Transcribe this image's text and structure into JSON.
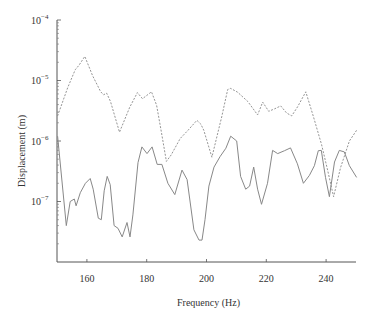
{
  "chart_data": {
    "type": "line",
    "title": "",
    "xlabel": "Frequency (Hz)",
    "ylabel": "Displacement (m)",
    "xlim": [
      150,
      250
    ],
    "ylim": [
      1e-08,
      0.0001
    ],
    "yscale": "log",
    "xticks": [
      160,
      180,
      200,
      220,
      240
    ],
    "xtick_labels": [
      "160",
      "180",
      "200",
      "220",
      "240"
    ],
    "yticks": [
      1e-07,
      1e-06,
      1e-05,
      0.0001
    ],
    "ytick_labels": [
      {
        "base": "10",
        "exp": "−7"
      },
      {
        "base": "10",
        "exp": "−6"
      },
      {
        "base": "10",
        "exp": "−5"
      },
      {
        "base": "10",
        "exp": "−4"
      }
    ],
    "grid": false,
    "legend": null,
    "series": [
      {
        "name": "dashed",
        "style": "dashed",
        "color": "#888888",
        "x": [
          150.2,
          153.6,
          156.1,
          157.4,
          159.3,
          161.9,
          164.6,
          165.6,
          166.6,
          167.9,
          170.9,
          174.3,
          176.9,
          178.6,
          181.6,
          183.3,
          184.9,
          186.6,
          188.2,
          191.2,
          193.8,
          196.8,
          198.1,
          199.1,
          201.8,
          205.1,
          207.1,
          208.1,
          210.4,
          213.8,
          217.1,
          218.8,
          220.8,
          222.8,
          224.8,
          226.8,
          228.5,
          230.5,
          233.2,
          235.8,
          238.5,
          240.5,
          242.5,
          244.8,
          247.8,
          250.2
        ],
        "y": [
          2.6e-06,
          7.7e-06,
          1.5e-05,
          1.8e-05,
          2.5e-05,
          1.2e-05,
          6.5e-06,
          5.8e-06,
          6.2e-06,
          4.5e-06,
          1.4e-06,
          3.6e-06,
          6.3e-06,
          5e-06,
          6.5e-06,
          3.9e-06,
          1.4e-06,
          4.6e-07,
          5.9e-07,
          1.1e-06,
          1.5e-06,
          2.2e-06,
          1.9e-06,
          1.5e-06,
          5.4e-07,
          2.5e-06,
          7.1e-06,
          7.4e-06,
          6.4e-06,
          4.5e-06,
          2.7e-06,
          4.4e-06,
          3.1e-06,
          3.4e-06,
          3.8e-06,
          2.9e-06,
          2.6e-06,
          3.7e-06,
          6.5e-06,
          2.5e-06,
          8.7e-07,
          3.3e-07,
          1.2e-07,
          3.6e-07,
          1e-06,
          1.5e-06
        ]
      },
      {
        "name": "solid",
        "style": "solid",
        "color": "#888888",
        "x": [
          150.2,
          153.1,
          154.4,
          155.8,
          156.4,
          157.8,
          159.5,
          161.1,
          162.1,
          163.8,
          164.8,
          165.8,
          166.8,
          167.8,
          169.1,
          170.4,
          171.8,
          173.4,
          174.4,
          175.4,
          177.1,
          178.4,
          180.1,
          181.8,
          183.5,
          185.1,
          187.1,
          189.4,
          191.8,
          193.5,
          195.8,
          197.5,
          198.5,
          199.5,
          200.8,
          202.5,
          204.5,
          206.5,
          208.1,
          210.1,
          211.4,
          213.1,
          214.4,
          215.8,
          217.1,
          218.4,
          220.4,
          222.1,
          223.8,
          226.1,
          228.1,
          230.4,
          232.4,
          234.4,
          236.1,
          237.4,
          238.4,
          239.8,
          241.1,
          242.8,
          244.4,
          246.1,
          247.8,
          250.2
        ],
        "y": [
          1.2e-06,
          4e-08,
          1e-07,
          1.1e-07,
          8.5e-08,
          1.4e-07,
          2e-07,
          2.4e-07,
          1.6e-07,
          5.3e-08,
          5e-08,
          1.5e-07,
          2.6e-07,
          1.9e-07,
          4e-08,
          3.6e-08,
          2.6e-08,
          4.5e-08,
          2.6e-08,
          6e-08,
          4.4e-07,
          8e-07,
          6.2e-07,
          8e-07,
          4.1e-07,
          4.1e-07,
          2e-07,
          1.3e-07,
          3.3e-07,
          2.3e-07,
          3.4e-08,
          2.3e-08,
          2.3e-08,
          5e-08,
          1.8e-07,
          3.7e-07,
          5.5e-07,
          7.6e-07,
          1.2e-06,
          1e-06,
          2.6e-07,
          1.6e-07,
          1.8e-07,
          3.7e-07,
          1.6e-07,
          9e-08,
          2e-07,
          7e-07,
          6.2e-07,
          6.9e-07,
          7.7e-07,
          4.2e-07,
          2e-07,
          2.7e-07,
          3.9e-07,
          6.9e-07,
          7e-07,
          2.5e-07,
          1.2e-07,
          4.5e-07,
          7e-07,
          6.6e-07,
          3.9e-07,
          2.5e-07
        ]
      }
    ]
  },
  "plot_area": {
    "left": 57,
    "right": 356,
    "top": 20,
    "bottom": 262
  }
}
